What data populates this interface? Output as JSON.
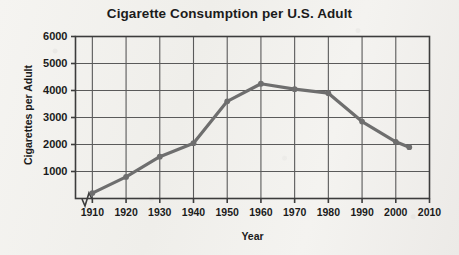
{
  "chart_data": {
    "type": "line",
    "title": "Cigarette Consumption per U.S. Adult",
    "xlabel": "Year",
    "ylabel": "Cigarettes per Adult",
    "xlim": [
      1905,
      2010
    ],
    "ylim": [
      0,
      6000
    ],
    "x_ticks": [
      1910,
      1920,
      1930,
      1940,
      1950,
      1960,
      1970,
      1980,
      1990,
      2000,
      2010
    ],
    "y_ticks": [
      1000,
      2000,
      3000,
      4000,
      5000,
      6000
    ],
    "grid": true,
    "legend": "none",
    "axis_break": "x-axis zigzag break between origin and 1910",
    "line_color": "#6e6e6e",
    "marker": "circle",
    "x": [
      1910,
      1920,
      1930,
      1940,
      1950,
      1960,
      1970,
      1980,
      1990,
      2000,
      2004
    ],
    "values": [
      200,
      800,
      1550,
      2050,
      3600,
      4250,
      4050,
      3900,
      2850,
      2100,
      1900
    ],
    "series": [
      {
        "name": "Cigarettes per Adult",
        "values": [
          200,
          800,
          1550,
          2050,
          3600,
          4250,
          4050,
          3900,
          2850,
          2100,
          1900
        ]
      }
    ]
  },
  "colors": {
    "background": "#f2f1ee",
    "grid": "#5a5a5a",
    "frame": "#3c3c3c",
    "line": "#6e6e6e",
    "text": "#1b1b1b"
  }
}
